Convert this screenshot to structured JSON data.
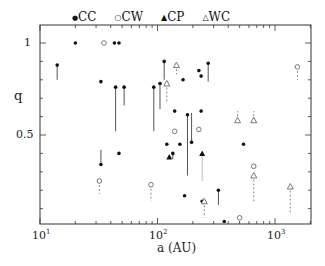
{
  "chart_data": {
    "type": "scatter",
    "title": "",
    "xlabel": "a (AU)",
    "ylabel": "q",
    "xscale": "log",
    "xlim": [
      10,
      2000
    ],
    "ylim": [
      0,
      1.1
    ],
    "xticks": [
      "10^1",
      "10^2",
      "10^3"
    ],
    "yticks": [
      "0.5",
      "1"
    ],
    "grid": false,
    "legend_position": "top",
    "legend": [
      {
        "name": "CC",
        "marker": "filled-circle"
      },
      {
        "name": "CW",
        "marker": "open-circle"
      },
      {
        "name": "CP",
        "marker": "filled-triangle"
      },
      {
        "name": "WC",
        "marker": "open-triangle"
      }
    ],
    "series": [
      {
        "name": "CC",
        "points": [
          {
            "a": 14,
            "q": 0.88,
            "err_to": 0.8
          },
          {
            "a": 20,
            "q": 1.0
          },
          {
            "a": 33,
            "q": 0.34,
            "err_to": 0.42
          },
          {
            "a": 33,
            "q": 0.79
          },
          {
            "a": 43,
            "q": 1.0
          },
          {
            "a": 47,
            "q": 1.0
          },
          {
            "a": 44,
            "q": 0.76,
            "err_to": 0.52
          },
          {
            "a": 47,
            "q": 0.4
          },
          {
            "a": 52,
            "q": 0.76,
            "err_to": 0.66
          },
          {
            "a": 93,
            "q": 0.76,
            "err_to": 0.52
          },
          {
            "a": 105,
            "q": 0.78,
            "err_to": 0.64
          },
          {
            "a": 114,
            "q": 0.9,
            "err_to": 0.8
          },
          {
            "a": 120,
            "q": 0.45
          },
          {
            "a": 135,
            "q": 0.4,
            "err_to": 0.37
          },
          {
            "a": 140,
            "q": 0.63
          },
          {
            "a": 155,
            "q": 0.45
          },
          {
            "a": 165,
            "q": 0.8
          },
          {
            "a": 170,
            "q": 0.17
          },
          {
            "a": 180,
            "q": 0.61,
            "err_to": 0.28
          },
          {
            "a": 195,
            "q": 0.46,
            "err_to": 0.62
          },
          {
            "a": 225,
            "q": 0.85
          },
          {
            "a": 235,
            "q": 0.82
          },
          {
            "a": 235,
            "q": 0.63
          },
          {
            "a": 240,
            "q": 0.14
          },
          {
            "a": 270,
            "q": 0.89,
            "err_to": 0.79
          },
          {
            "a": 330,
            "q": 0.2,
            "err_to": 0.12
          },
          {
            "a": 370,
            "q": 0.03
          },
          {
            "a": 540,
            "q": 0.45
          }
        ]
      },
      {
        "name": "CW",
        "points": [
          {
            "a": 32,
            "q": 0.25,
            "err_to": 0.18
          },
          {
            "a": 35,
            "q": 1.0
          },
          {
            "a": 88,
            "q": 0.23,
            "err_to": 0.14
          },
          {
            "a": 140,
            "q": 0.52
          },
          {
            "a": 225,
            "q": 0.53
          },
          {
            "a": 500,
            "q": 0.05
          },
          {
            "a": 660,
            "q": 0.33
          },
          {
            "a": 1550,
            "q": 0.87,
            "err_to": 0.8
          }
        ]
      },
      {
        "name": "CP",
        "points": [
          {
            "a": 126,
            "q": 0.38
          },
          {
            "a": 240,
            "q": 0.4,
            "err_to": 0.25
          }
        ]
      },
      {
        "name": "WC",
        "points": [
          {
            "a": 120,
            "q": 0.78,
            "err_to": 0.68
          },
          {
            "a": 145,
            "q": 0.88,
            "err_to": 0.83
          },
          {
            "a": 250,
            "q": 0.14,
            "err_to": 0.05
          },
          {
            "a": 480,
            "q": 0.58,
            "err_to": 0.63
          },
          {
            "a": 660,
            "q": 0.58,
            "err_to": 0.63
          },
          {
            "a": 660,
            "q": 0.28,
            "err_to": 0.14
          },
          {
            "a": 1350,
            "q": 0.22,
            "err_to": 0.08
          }
        ]
      }
    ]
  },
  "axes": {
    "xlabel": "a (AU)",
    "ylabel": "q",
    "x_tick_labels": [
      {
        "base": "10",
        "exp": "1"
      },
      {
        "base": "10",
        "exp": "2"
      },
      {
        "base": "10",
        "exp": "3"
      }
    ],
    "y_tick_labels": [
      "0.5",
      "1"
    ]
  },
  "legend": {
    "items": [
      {
        "symbol": "●",
        "label": "CC"
      },
      {
        "symbol": "○",
        "label": "CW"
      },
      {
        "symbol": "▲",
        "label": "CP"
      },
      {
        "symbol": "△",
        "label": "WC"
      }
    ]
  }
}
